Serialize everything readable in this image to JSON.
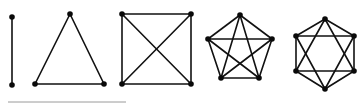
{
  "diagram": {
    "colors": {
      "edge": "#111111",
      "vertex": "#0a0a0a",
      "background": "#ffffff",
      "rule": "#9a9a9a"
    },
    "graphs": [
      {
        "name": "K2",
        "vertices": [
          [
            12,
            17
          ],
          [
            12,
            85
          ]
        ],
        "edges": [
          [
            0,
            1
          ]
        ]
      },
      {
        "name": "K3",
        "vertices": [
          [
            70,
            14
          ],
          [
            35,
            84
          ],
          [
            104,
            84
          ]
        ],
        "edges": [
          [
            0,
            1
          ],
          [
            1,
            2
          ],
          [
            2,
            0
          ]
        ]
      },
      {
        "name": "K4",
        "vertices": [
          [
            122,
            14
          ],
          [
            191,
            14
          ],
          [
            191,
            84
          ],
          [
            122,
            84
          ]
        ],
        "edges": [
          [
            0,
            1
          ],
          [
            1,
            2
          ],
          [
            2,
            3
          ],
          [
            3,
            0
          ],
          [
            0,
            2
          ],
          [
            1,
            3
          ]
        ]
      },
      {
        "name": "K5",
        "vertices": [
          [
            240,
            15
          ],
          [
            272,
            39
          ],
          [
            259,
            78
          ],
          [
            221,
            78
          ],
          [
            208,
            39
          ]
        ],
        "edges": [
          [
            0,
            1
          ],
          [
            1,
            2
          ],
          [
            2,
            3
          ],
          [
            3,
            4
          ],
          [
            4,
            0
          ],
          [
            0,
            2
          ],
          [
            0,
            3
          ],
          [
            1,
            3
          ],
          [
            1,
            4
          ],
          [
            2,
            4
          ]
        ]
      },
      {
        "name": "hexagon-star",
        "vertices": [
          [
            325,
            19
          ],
          [
            354,
            36
          ],
          [
            354,
            71
          ],
          [
            325,
            89
          ],
          [
            296,
            71
          ],
          [
            296,
            36
          ]
        ],
        "edges": [
          [
            0,
            1
          ],
          [
            1,
            2
          ],
          [
            2,
            3
          ],
          [
            3,
            4
          ],
          [
            4,
            5
          ],
          [
            5,
            0
          ],
          [
            0,
            2
          ],
          [
            2,
            4
          ],
          [
            4,
            0
          ],
          [
            1,
            3
          ],
          [
            3,
            5
          ],
          [
            5,
            1
          ]
        ]
      }
    ],
    "rule": {
      "x1": 8,
      "x2": 126,
      "y": 102
    }
  }
}
